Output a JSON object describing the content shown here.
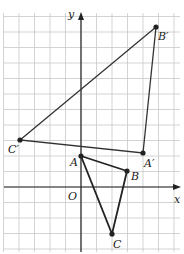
{
  "figure": {
    "axes": {
      "x_label": "x",
      "y_label": "y",
      "origin_label": "O"
    },
    "grid": {
      "unit_px": 15.5,
      "origin_px": [
        81,
        187
      ]
    },
    "triangle_original": {
      "color": "#222222",
      "points": {
        "A": {
          "label": "A",
          "px": [
            81,
            156
          ]
        },
        "B": {
          "label": "B",
          "px": [
            127,
            171
          ]
        },
        "C": {
          "label": "C",
          "px": [
            112,
            234
          ]
        }
      }
    },
    "triangle_image": {
      "color": "#333333",
      "points": {
        "A'": {
          "label": "A′",
          "px": [
            143,
            153
          ]
        },
        "B'": {
          "label": "B′",
          "px": [
            156,
            27
          ]
        },
        "C'": {
          "label": "C′",
          "px": [
            20,
            140
          ]
        }
      }
    }
  }
}
